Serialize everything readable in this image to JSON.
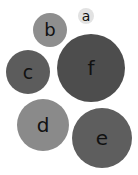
{
  "chart_data": {
    "type": "bubble",
    "title": "",
    "bubbles": [
      {
        "label": "a",
        "cx": 86,
        "cy": 16,
        "r": 8,
        "color": "#e2e2e2",
        "font": 14
      },
      {
        "label": "b",
        "cx": 50,
        "cy": 30,
        "r": 17,
        "color": "#8e8e8e",
        "font": 18
      },
      {
        "label": "c",
        "cx": 28,
        "cy": 72,
        "r": 22,
        "color": "#5c5c5c",
        "font": 19
      },
      {
        "label": "f",
        "cx": 91,
        "cy": 68,
        "r": 34,
        "color": "#4d4d4d",
        "font": 20
      },
      {
        "label": "d",
        "cx": 43,
        "cy": 125,
        "r": 26,
        "color": "#8a8a8a",
        "font": 20
      },
      {
        "label": "e",
        "cx": 102,
        "cy": 138,
        "r": 30,
        "color": "#5e5e5e",
        "font": 20
      }
    ]
  }
}
